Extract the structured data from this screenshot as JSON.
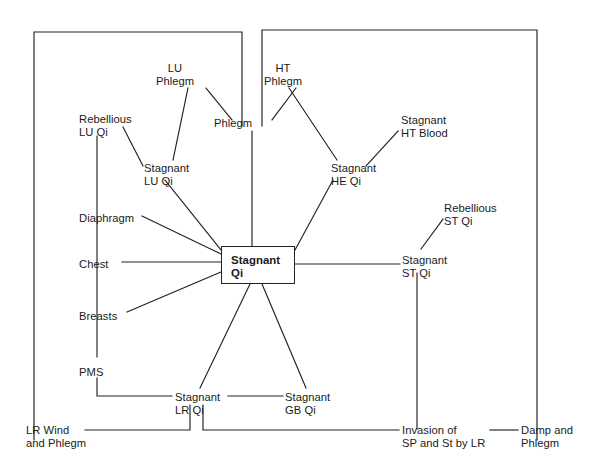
{
  "diagram": {
    "title": "Stagnant Qi",
    "center": {
      "label": "Stagnant\nQi",
      "x": 221,
      "y": 246,
      "w": 74,
      "h": 38
    },
    "nodes": [
      {
        "id": "lu-phlegm",
        "label": "LU\nPhlegm",
        "x": 175,
        "y": 62,
        "align": "center"
      },
      {
        "id": "ht-phlegm",
        "label": "HT\nPhlegm",
        "x": 283,
        "y": 62,
        "align": "center"
      },
      {
        "id": "phlegm",
        "label": "Phlegm",
        "x": 233,
        "y": 117,
        "align": "center"
      },
      {
        "id": "rebellious-lu-qi",
        "label": "Rebellious\nLU Qi",
        "x": 79,
        "y": 113,
        "align": "left"
      },
      {
        "id": "stagnant-lu-qi",
        "label": "Stagnant\nLU Qi",
        "x": 144,
        "y": 162,
        "align": "left"
      },
      {
        "id": "stagnant-ht-blood",
        "label": "Stagnant\nHT Blood",
        "x": 401,
        "y": 114,
        "align": "left"
      },
      {
        "id": "stagnant-he-qi",
        "label": "Stagnant\nHE Qi",
        "x": 331,
        "y": 162,
        "align": "left"
      },
      {
        "id": "rebellious-st-qi",
        "label": "Rebellious\nST Qi",
        "x": 444,
        "y": 202,
        "align": "left"
      },
      {
        "id": "stagnant-st-qi",
        "label": "Stagnant\nST Qi",
        "x": 402,
        "y": 254,
        "align": "left"
      },
      {
        "id": "diaphragm",
        "label": "Diaphragm",
        "x": 79,
        "y": 212,
        "align": "left"
      },
      {
        "id": "chest",
        "label": "Chest",
        "x": 79,
        "y": 258,
        "align": "left"
      },
      {
        "id": "breasts",
        "label": "Breasts",
        "x": 79,
        "y": 310,
        "align": "left"
      },
      {
        "id": "pms",
        "label": "PMS",
        "x": 79,
        "y": 366,
        "align": "left"
      },
      {
        "id": "stagnant-lr-qi",
        "label": "Stagnant\nLR Qi",
        "x": 175,
        "y": 391,
        "align": "left"
      },
      {
        "id": "stagnant-gb-qi",
        "label": "Stagnant\nGB Qi",
        "x": 285,
        "y": 391,
        "align": "left"
      },
      {
        "id": "lr-wind-phlegm",
        "label": "LR Wind\nand Phlegm",
        "x": 26,
        "y": 424,
        "align": "left"
      },
      {
        "id": "invasion-sp-st",
        "label": "Invasion of\nSP and St by LR",
        "x": 402,
        "y": 424,
        "align": "left"
      },
      {
        "id": "damp-phlegm",
        "label": "Damp and\nPhlegm",
        "x": 521,
        "y": 424,
        "align": "left"
      }
    ],
    "edges": [
      {
        "from": "border-left-top",
        "to": "phlegm-left",
        "type": "elbow",
        "points": "34,440 34,32 242,32 242,126"
      },
      {
        "from": "border-right-top",
        "to": "phlegm-right",
        "type": "elbow",
        "points": "262,126 262,30 537,30 537,440"
      },
      {
        "from": "lu-phlegm",
        "to": "phlegm",
        "type": "line",
        "points": "206,88 232,120"
      },
      {
        "from": "ht-phlegm",
        "to": "phlegm",
        "type": "line",
        "points": "296,88 272,120"
      },
      {
        "from": "phlegm",
        "to": "center",
        "type": "line",
        "points": "252,131 252,246"
      },
      {
        "from": "lu-phlegm",
        "to": "stagnant-lu-qi",
        "type": "line",
        "points": "188,88 173,160"
      },
      {
        "from": "rebellious-lu-qi",
        "to": "stagnant-lu-qi",
        "type": "line",
        "points": "123,127 143,166"
      },
      {
        "from": "stagnant-lu-qi",
        "to": "center",
        "type": "line",
        "points": "165,180 221,250"
      },
      {
        "from": "ht-phlegm",
        "to": "stagnant-he-qi",
        "type": "line",
        "points": "289,88 337,160"
      },
      {
        "from": "stagnant-ht-blood",
        "to": "stagnant-he-qi",
        "type": "line",
        "points": "398,131 366,166"
      },
      {
        "from": "stagnant-he-qi",
        "to": "center",
        "type": "line",
        "points": "333,180 295,250"
      },
      {
        "from": "rebellious-lu-qi",
        "to": "pms",
        "type": "vline",
        "points": "97,136 97,357"
      },
      {
        "from": "diaphragm",
        "to": "center",
        "type": "line",
        "points": "142,216 221,254"
      },
      {
        "from": "chest",
        "to": "center",
        "type": "line",
        "points": "122,262 221,262"
      },
      {
        "from": "breasts",
        "to": "center",
        "type": "line",
        "points": "127,312 221,272"
      },
      {
        "from": "pms",
        "to": "stagnant-lr-qi",
        "type": "elbow",
        "points": "97,378 97,396 172,396"
      },
      {
        "from": "center",
        "to": "stagnant-lr-qi",
        "type": "line",
        "points": "250,284 200,388"
      },
      {
        "from": "center",
        "to": "stagnant-gb-qi",
        "type": "line",
        "points": "262,284 306,388"
      },
      {
        "from": "stagnant-lr-qi",
        "to": "stagnant-gb-qi",
        "type": "line",
        "points": "228,396 283,396"
      },
      {
        "from": "center",
        "to": "stagnant-st-qi",
        "type": "line",
        "points": "295,264 400,264"
      },
      {
        "from": "stagnant-st-qi",
        "to": "rebellious-st-qi",
        "type": "line",
        "points": "421,249 443,219"
      },
      {
        "from": "stagnant-st-qi",
        "to": "invasion-sp-st",
        "type": "vline",
        "points": "417,273 417,429"
      },
      {
        "from": "stagnant-lr-qi",
        "to": "lr-wind-phlegm",
        "type": "elbow",
        "points": "190,405 190,430 85,430"
      },
      {
        "from": "stagnant-lr-qi",
        "to": "invasion-sp-st",
        "type": "elbow",
        "points": "203,405 203,430 399,430"
      },
      {
        "from": "damp-phlegm",
        "to": "right-border",
        "type": "line",
        "points": "490,430 518,430"
      }
    ],
    "colors": {
      "line": "#222222",
      "text": "#1a1a1a",
      "background": "#ffffff"
    }
  },
  "footer": {
    "mark": ""
  }
}
